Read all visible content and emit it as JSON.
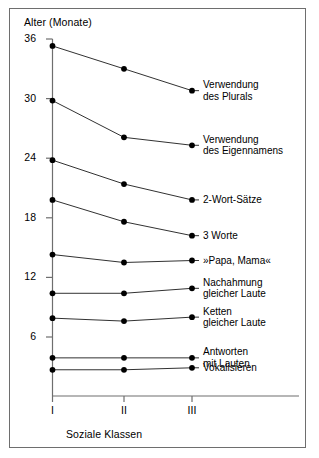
{
  "figure": {
    "y_axis_title": "Alter (Monate)",
    "x_axis_title": "Soziale Klassen"
  },
  "chart_data": {
    "type": "line",
    "title": "",
    "xlabel": "Soziale Klassen",
    "ylabel": "Alter (Monate)",
    "categories": [
      "I",
      "II",
      "III"
    ],
    "yticks": [
      36,
      30,
      24,
      18,
      12,
      6
    ],
    "ylim": [
      0,
      36
    ],
    "grid": false,
    "legend": "right-inline-labels",
    "marker": "filled-circle",
    "line_color": "#1a1a1a",
    "marker_color": "#000000",
    "series": [
      {
        "name": "Verwendung des Plurals",
        "label_lines": [
          "Verwendung",
          "des Plurals"
        ],
        "values": [
          35.3,
          33.0,
          30.8
        ]
      },
      {
        "name": "Verwendung des Eigennamens",
        "label_lines": [
          "Verwendung",
          "des Eigennamens"
        ],
        "values": [
          29.8,
          26.1,
          25.3
        ]
      },
      {
        "name": "2-Wort-Sätze",
        "label_lines": [
          "2-Wort-Sätze"
        ],
        "values": [
          23.8,
          21.4,
          19.8
        ]
      },
      {
        "name": "3 Worte",
        "label_lines": [
          "3 Worte"
        ],
        "values": [
          19.8,
          17.6,
          16.2
        ]
      },
      {
        "name": "»Papa, Mama«",
        "label_lines": [
          "»Papa, Mama«"
        ],
        "values": [
          14.3,
          13.5,
          13.7
        ]
      },
      {
        "name": "Nachahmung gleicher Laute",
        "label_lines": [
          "Nachahmung",
          "gleicher Laute"
        ],
        "values": [
          10.4,
          10.4,
          10.9
        ]
      },
      {
        "name": "Ketten gleicher Laute",
        "label_lines": [
          "Ketten",
          "gleicher Laute"
        ],
        "values": [
          7.9,
          7.6,
          8.0
        ]
      },
      {
        "name": "Antworten mit Lauten",
        "label_lines": [
          "Antworten",
          "mit Lauten"
        ],
        "values": [
          3.9,
          3.9,
          3.9
        ]
      },
      {
        "name": "Vokalisieren",
        "label_lines": [
          "Vokalisieren"
        ],
        "values": [
          2.7,
          2.7,
          2.9
        ]
      }
    ]
  }
}
